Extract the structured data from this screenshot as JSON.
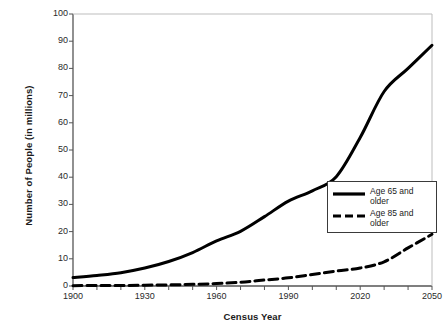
{
  "chart_data": {
    "type": "line",
    "title": "",
    "xlabel": "Census Year",
    "ylabel": "Number of People (in millions)",
    "xlim": [
      1900,
      2050
    ],
    "ylim": [
      0,
      100
    ],
    "ytick_labels": [
      "0",
      "10",
      "20",
      "30",
      "40",
      "50",
      "60",
      "70",
      "80",
      "90",
      "100"
    ],
    "ytick_values": [
      0,
      10,
      20,
      30,
      40,
      50,
      60,
      70,
      80,
      90,
      100
    ],
    "xtick_labels": [
      "1900",
      "1930",
      "1960",
      "1990",
      "2020",
      "2050"
    ],
    "xtick_values": [
      1900,
      1930,
      1960,
      1990,
      2020,
      2050
    ],
    "minor_xticks_interval": 10,
    "grid": false,
    "legend_position": "inside-top-right",
    "x": [
      1900,
      1910,
      1920,
      1930,
      1940,
      1950,
      1960,
      1970,
      1980,
      1990,
      2000,
      2010,
      2020,
      2030,
      2040,
      2050
    ],
    "series": [
      {
        "name": "Age 65 and older",
        "style": "solid",
        "color": "#000000",
        "values": [
          3.1,
          3.9,
          4.9,
          6.6,
          9.0,
          12.3,
          16.6,
          20.1,
          25.5,
          31.2,
          35.0,
          40.2,
          54.6,
          71.5,
          80.0,
          88.5
        ]
      },
      {
        "name": "Age 85 and older",
        "style": "dashed",
        "color": "#000000",
        "values": [
          0.1,
          0.2,
          0.2,
          0.3,
          0.4,
          0.6,
          0.9,
          1.4,
          2.2,
          3.0,
          4.2,
          5.5,
          6.6,
          8.9,
          14.0,
          19.0
        ]
      }
    ]
  },
  "legend": {
    "items": [
      {
        "label_line1": "Age 65 and",
        "label_line2": "older",
        "style": "solid"
      },
      {
        "label_line1": "Age 85 and",
        "label_line2": "older",
        "style": "dashed"
      }
    ]
  }
}
